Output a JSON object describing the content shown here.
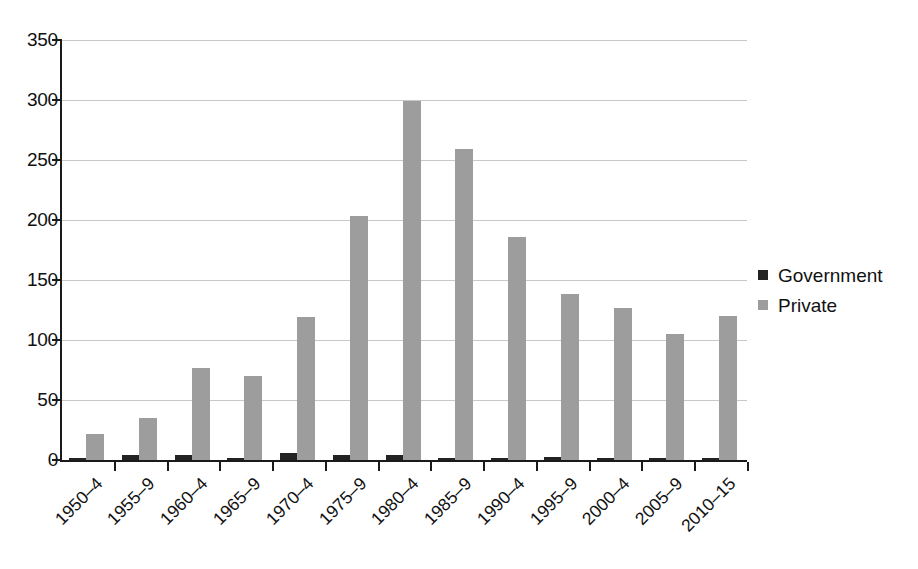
{
  "chart_data": {
    "type": "bar",
    "title": "",
    "subtitle": "",
    "xlabel": "",
    "ylabel": "",
    "ylim": [
      0,
      350
    ],
    "yticks": [
      0,
      50,
      100,
      150,
      200,
      250,
      300,
      350
    ],
    "ytick_labels": [
      "0",
      "50",
      "100",
      "150",
      "200",
      "250",
      "300",
      "350"
    ],
    "grid": true,
    "grid_axis": "y",
    "legend_position": "right",
    "bar_grouping": "grouped",
    "categories": [
      "1950–4",
      "1955–9",
      "1960–4",
      "1965–9",
      "1970–4",
      "1975–9",
      "1980–4",
      "1985–9",
      "1990–4",
      "1995–9",
      "2000–4",
      "2005–9",
      "2010–15"
    ],
    "series": [
      {
        "name": "Government",
        "color": "#232323",
        "values": [
          2,
          4,
          4,
          1,
          6,
          4.5,
          4.5,
          1.5,
          1,
          2.5,
          1.5,
          1.5,
          0.8
        ]
      },
      {
        "name": "Private",
        "color": "#9d9d9d",
        "values": [
          22,
          35,
          77,
          70,
          119,
          203,
          299,
          259,
          186,
          138,
          127,
          105,
          120
        ]
      }
    ]
  },
  "legend": {
    "items": [
      {
        "label": "Government",
        "swatch": "legend-swatch-government"
      },
      {
        "label": "Private",
        "swatch": "legend-swatch-private"
      }
    ]
  },
  "colors": {
    "government": "#232323",
    "private": "#9d9d9d",
    "axis": "#1a1a1a",
    "gridline": "#c8c8c8",
    "background": "#ffffff"
  }
}
